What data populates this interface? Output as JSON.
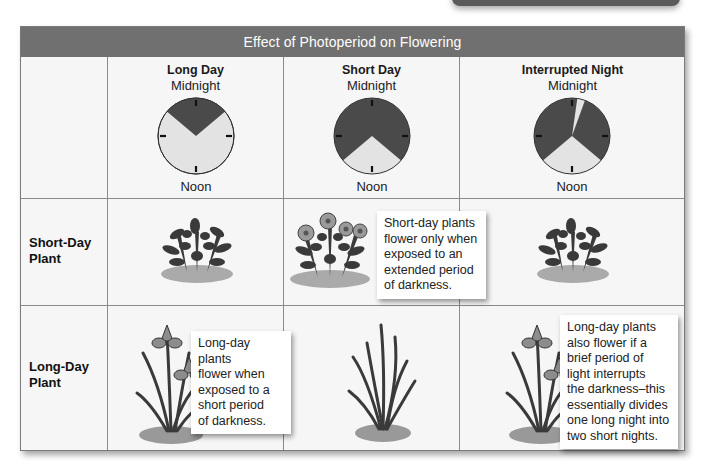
{
  "title": "Effect of Photoperiod on Flowering",
  "columns": [
    {
      "name": "Long Day",
      "top_label": "Midnight",
      "bottom_label": "Noon",
      "dark_arcs": [
        [
          -50,
          50
        ]
      ],
      "light_arcs": [
        [
          50,
          310
        ]
      ]
    },
    {
      "name": "Short Day",
      "top_label": "Midnight",
      "bottom_label": "Noon",
      "dark_arcs": [
        [
          -130,
          130
        ]
      ],
      "light_arcs": [
        [
          130,
          230
        ]
      ]
    },
    {
      "name": "Interrupted Night",
      "top_label": "Midnight",
      "bottom_label": "Noon",
      "dark_arcs": [
        [
          -130,
          8
        ],
        [
          20,
          130
        ]
      ],
      "light_arcs": [
        [
          8,
          20
        ],
        [
          130,
          230
        ]
      ]
    }
  ],
  "rows": [
    {
      "label_line1": "Short-Day",
      "label_line2": "Plant",
      "cells": [
        "bush, no flowers",
        "bush with flowers",
        "bush, no flowers"
      ]
    },
    {
      "label_line1": "Long-Day",
      "label_line2": "Plant",
      "cells": [
        "iris with flowers",
        "leaves only, no flowers",
        "iris with flowers"
      ]
    }
  ],
  "callouts": {
    "short_day": [
      "Short-day plants",
      "flower only when",
      "exposed to an",
      "extended period",
      "of darkness."
    ],
    "long_day": [
      "Long-day plants",
      "flower when",
      "exposed to a",
      "short period",
      "of darkness."
    ],
    "interrupted": [
      "Long-day plants",
      "also flower if a",
      "brief period of",
      "light interrupts",
      "the darkness–this",
      "essentially divides",
      "one long night into",
      "two short nights."
    ]
  },
  "colors": {
    "header_bg": "#707070",
    "dark_period": "#4a4a4a",
    "light_period": "#e3e3e3",
    "table_bg": "#f6f6f6"
  }
}
